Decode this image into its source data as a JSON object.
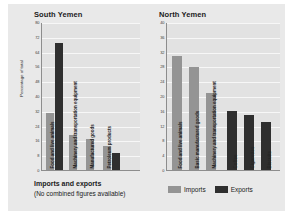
{
  "figure": {
    "caption_title": "Imports and exports",
    "caption_note": "(No combined figures available)",
    "ylabel": "Percentage of total",
    "legend": [
      {
        "label": "Imports",
        "color": "#949494"
      },
      {
        "label": "Exports",
        "color": "#2f2f2f"
      }
    ]
  },
  "chart_data": [
    {
      "type": "bar",
      "title": "South Yemen",
      "xlabel": "",
      "ylabel": "Percentage of total",
      "ylim": [
        0,
        80
      ],
      "yticks": [
        0,
        8,
        16,
        24,
        32,
        40,
        48,
        56,
        64,
        72,
        80
      ],
      "grid": true,
      "legend_position": "bottom",
      "categories": [
        "Food and live animals",
        "Machinery and transportation equipment",
        "Manufactured goods",
        "Petroleum products"
      ],
      "bars": [
        {
          "category": "Food and live animals",
          "series": "Imports",
          "value": 31
        },
        {
          "category": "Food and live animals",
          "series": "Exports",
          "value": 69
        },
        {
          "category": "Machinery and transportation equipment",
          "series": "Imports",
          "value": 19
        },
        {
          "category": "Manufactured goods",
          "series": "Imports",
          "value": 17
        },
        {
          "category": "Petroleum products",
          "series": "Imports",
          "value": 13
        },
        {
          "category": "Petroleum products",
          "series": "Exports",
          "value": 9
        }
      ]
    },
    {
      "type": "bar",
      "title": "North Yemen",
      "xlabel": "",
      "ylabel": "Percentage of total",
      "ylim": [
        0,
        40
      ],
      "yticks": [
        0,
        4,
        8,
        12,
        16,
        20,
        24,
        28,
        32,
        36,
        40
      ],
      "grid": true,
      "legend_position": "bottom",
      "categories": [
        "Food and live animals",
        "Basic manufactured goods",
        "Machinery and transportation equipment",
        "Coffee",
        "Cigarettes",
        "Biscuits"
      ],
      "bars": [
        {
          "category": "Food and live animals",
          "series": "Imports",
          "value": 31
        },
        {
          "category": "Basic manufactured goods",
          "series": "Imports",
          "value": 28
        },
        {
          "category": "Machinery and transportation equipment",
          "series": "Imports",
          "value": 21
        },
        {
          "category": "Coffee",
          "series": "Exports",
          "value": 16
        },
        {
          "category": "Cigarettes",
          "series": "Exports",
          "value": 15
        },
        {
          "category": "Biscuits",
          "series": "Exports",
          "value": 13
        }
      ]
    }
  ]
}
